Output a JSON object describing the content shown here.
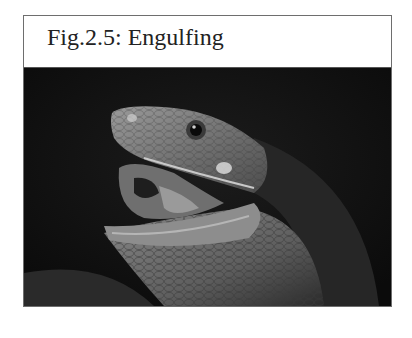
{
  "figure": {
    "caption": "Fig.2.5: Engulfing",
    "image": {
      "subject": "snake-head-open-mouth-photo",
      "description": "Grayscale close-up of a snake with its mouth open against a dark background"
    }
  }
}
